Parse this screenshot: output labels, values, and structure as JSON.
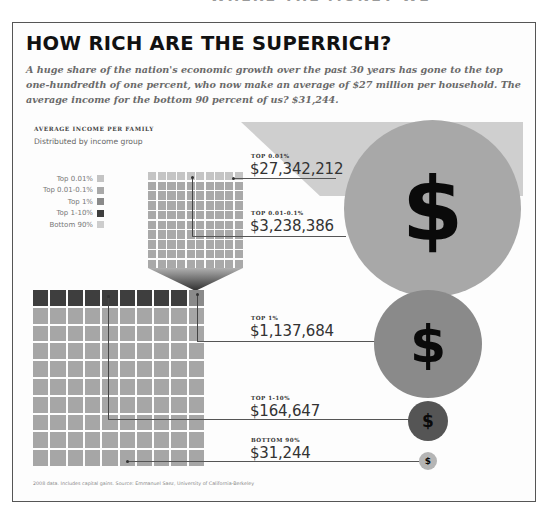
{
  "header": {
    "cutoff_text": "WHERE THE MONEY WENT",
    "title": "HOW RICH ARE THE SUPERRICH?",
    "dek": "A huge share of the nation's economic growth over the past 30 years has gone to the top one-hundredth of one percent, who now make an average of $27 million per household. The average income for the bottom 90 percent of us? $31,244."
  },
  "chart_header": {
    "kicker": "AVERAGE INCOME PER FAMILY",
    "subkicker": "Distributed by income group"
  },
  "legend": [
    {
      "label": "Top 0.01%",
      "color": "#c4c4c4"
    },
    {
      "label": "Top 0.01-0.1%",
      "color": "#a9a9a9"
    },
    {
      "label": "Top 1%",
      "color": "#8a8a8a"
    },
    {
      "label": "Top 1-10%",
      "color": "#3e3e3e"
    },
    {
      "label": "Bottom 90%",
      "color": "#cdcdcd"
    }
  ],
  "values": [
    {
      "label": "TOP 0.01%",
      "amount": "$27,342,212"
    },
    {
      "label": "TOP 0.01-0.1%",
      "amount": "$3,238,386"
    },
    {
      "label": "TOP 1%",
      "amount": "$1,137,684"
    },
    {
      "label": "TOP 1-10%",
      "amount": "$164,647"
    },
    {
      "label": "BOTTOM 90%",
      "amount": "$31,244"
    }
  ],
  "circles": {
    "symbol": "$",
    "colors": [
      "#a8a8a8",
      "#8a8a8a",
      "#555555",
      "#b5b5b5"
    ]
  },
  "footnote": "2008 data. Includes capital gains. Source: Emmanuel Saez, University of California-Berkeley",
  "chart_data": {
    "type": "bubble",
    "title": "HOW RICH ARE THE SUPERRICH?",
    "subtitle": "Average income per family, distributed by income group",
    "categories": [
      "Top 0.01%",
      "Top 0.01-0.1%",
      "Top 1%",
      "Top 1-10%",
      "Bottom 90%"
    ],
    "values": [
      27342212,
      3238386,
      1137684,
      164647,
      31244
    ],
    "unit": "USD",
    "year": 2008,
    "grid_representation": {
      "small_grid": {
        "rows": 10,
        "cols": 10,
        "top_row": "Top 0.01%",
        "rest": "Top 0.01-0.1%",
        "represents": "Top 1%"
      },
      "large_grid": {
        "rows": 10,
        "cols": 10,
        "top_row": [
          "Top 1-10% x9",
          "Top 1% x1"
        ],
        "rest": "Bottom 90%"
      }
    },
    "source": "Emmanuel Saez, University of California-Berkeley"
  }
}
